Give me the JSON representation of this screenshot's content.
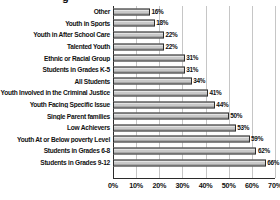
{
  "chart_data": {
    "type": "bar",
    "orientation": "horizontal",
    "title": "",
    "xlabel": "",
    "ylabel": "",
    "xlim": [
      0,
      70
    ],
    "grid": true,
    "legend": false,
    "xticks": [
      "0%",
      "10%",
      "20%",
      "30%",
      "40%",
      "50%",
      "60%",
      "70%"
    ],
    "xtick_values": [
      0,
      10,
      20,
      30,
      40,
      50,
      60,
      70
    ],
    "categories": [
      "Other",
      "Youth in Sports",
      "Youth in After School Care",
      "Talented Youth",
      "Ethnic or Racial Group",
      "Students in Grades K-5",
      "All Students",
      "Youth Involved in the Criminal Justice",
      "Youth Facing Specific Issue",
      "Single Parent families",
      "Low Achievers",
      "Youth At or Below poverty Level",
      "Students in Grades 6-8",
      "Students in Grades 9-12"
    ],
    "values": [
      16,
      18,
      22,
      22,
      31,
      31,
      34,
      41,
      44,
      50,
      53,
      59,
      62,
      66
    ],
    "data_labels": [
      "16%",
      "18%",
      "22%",
      "22%",
      "31%",
      "31%",
      "34%",
      "41%",
      "44%",
      "50%",
      "53%",
      "59%",
      "62%",
      "66%"
    ],
    "bar_fill_color": "#c9c9c9",
    "bar_edge_color": "#2b2b2b",
    "gridline_color": "#c6c6c6",
    "axis_color": "#2b2b2b",
    "background_color": "#ffffff"
  },
  "title_fragment": {
    "text": "g"
  }
}
